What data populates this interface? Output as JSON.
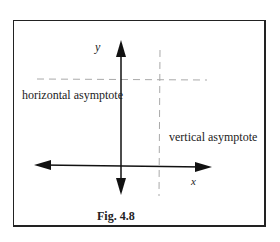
{
  "figure": {
    "caption": "Fig. 4.8",
    "axis_labels": {
      "x": "x",
      "y": "y"
    },
    "annotations": {
      "horizontal": "horizontal asymptote",
      "vertical": "vertical asymptote"
    }
  }
}
